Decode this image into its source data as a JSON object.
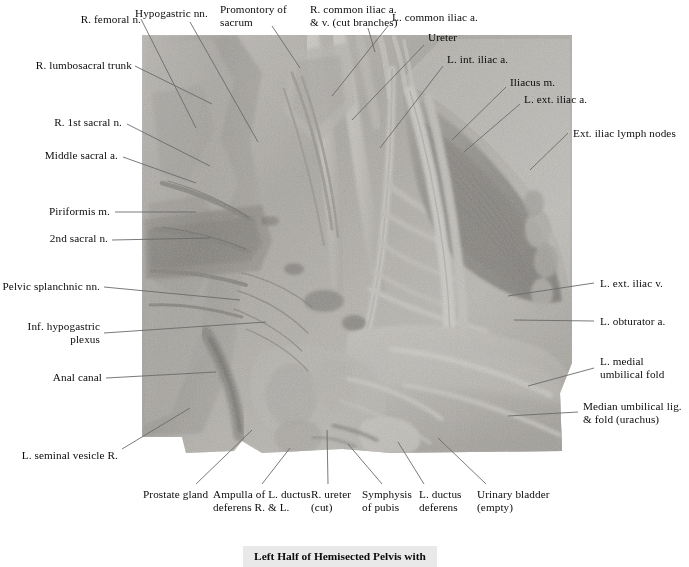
{
  "figure": {
    "title": "Left Half of Hemisected Pelvis with",
    "specimen_kind": "cadaveric-dissection-photograph",
    "specimen_tone": "grayscale"
  },
  "colors": {
    "page_background": "#ffffff",
    "leader_line": "#6b6b6b",
    "label_text": "#0b0b0b",
    "caption_band": "#e9e9e9"
  },
  "labels": {
    "top": [
      {
        "id": "r-femoral-n",
        "text": "R. femoral n.",
        "align": "right"
      },
      {
        "id": "hypogastric-nn",
        "text": "Hypogastric nn.",
        "align": "left"
      },
      {
        "id": "promontory-sacrum",
        "text": "Promontory of\nsacrum",
        "align": "left"
      },
      {
        "id": "r-common-iliac",
        "text": "R. common iliac a.\n& v. (cut branches)",
        "align": "left"
      },
      {
        "id": "l-common-iliac-a",
        "text": "L. common iliac a.",
        "align": "left"
      },
      {
        "id": "ureter",
        "text": "Ureter",
        "align": "left"
      },
      {
        "id": "l-int-iliac-a",
        "text": "L. int. iliac a.",
        "align": "left"
      },
      {
        "id": "iliacus-m",
        "text": "Iliacus m.",
        "align": "left"
      },
      {
        "id": "l-ext-iliac-a",
        "text": "L. ext. iliac a.",
        "align": "left"
      }
    ],
    "left": [
      {
        "id": "r-lumbosacral-trunk",
        "text": "R. lumbosacral trunk",
        "align": "right"
      },
      {
        "id": "r-1st-sacral-n",
        "text": "R. 1st sacral n.",
        "align": "right"
      },
      {
        "id": "middle-sacral-a",
        "text": "Middle sacral a.",
        "align": "right"
      },
      {
        "id": "piriformis-m",
        "text": "Piriformis m.",
        "align": "right"
      },
      {
        "id": "2nd-sacral-n",
        "text": "2nd sacral n.",
        "align": "right"
      },
      {
        "id": "pelvic-splanchnic",
        "text": "Pelvic splanchnic nn.",
        "align": "right"
      },
      {
        "id": "inf-hypogastric",
        "text": "Inf. hypogastric\nplexus",
        "align": "right"
      },
      {
        "id": "anal-canal",
        "text": "Anal canal",
        "align": "right"
      },
      {
        "id": "l-seminal-vesicle",
        "text": "L. seminal vesicle R.",
        "align": "right"
      }
    ],
    "right": [
      {
        "id": "ext-iliac-lymph",
        "text": "Ext. iliac lymph nodes",
        "align": "left"
      },
      {
        "id": "l-ext-iliac-v",
        "text": "L. ext. iliac v.",
        "align": "left"
      },
      {
        "id": "l-obturator-a",
        "text": "L. obturator a.",
        "align": "left"
      },
      {
        "id": "l-medial-umb-fold",
        "text": "L. medial\numbilical fold",
        "align": "left"
      },
      {
        "id": "median-umb-lig",
        "text": "Median umbilical lig.\n& fold (urachus)",
        "align": "left"
      }
    ],
    "bottom": [
      {
        "id": "prostate-gland",
        "text": "Prostate gland",
        "align": "left"
      },
      {
        "id": "ampulla-ductus",
        "text": "Ampulla of L. ductus\ndeferens R. & L.",
        "align": "left"
      },
      {
        "id": "r-ureter-cut",
        "text": "R. ureter\n(cut)",
        "align": "left"
      },
      {
        "id": "symphysis-pubis",
        "text": "Symphysis\nof pubis",
        "align": "left"
      },
      {
        "id": "l-ductus-deferens",
        "text": "L. ductus\ndeferens",
        "align": "left"
      },
      {
        "id": "urinary-bladder",
        "text": "Urinary bladder\n(empty)",
        "align": "left"
      }
    ]
  }
}
